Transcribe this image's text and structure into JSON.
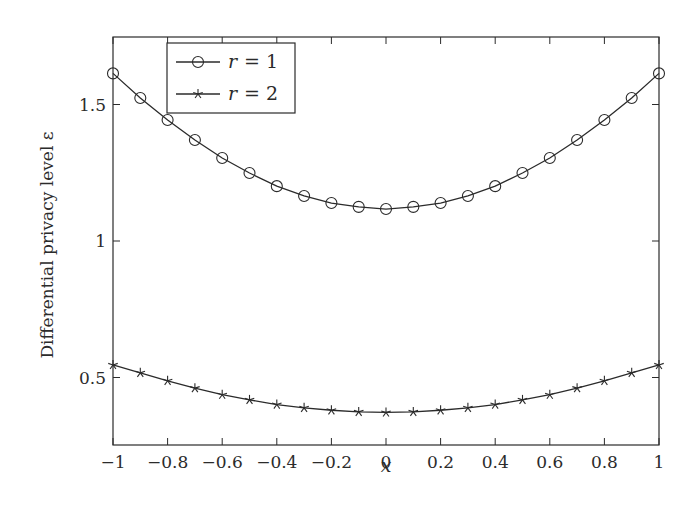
{
  "chart_data": {
    "type": "line",
    "title": "",
    "xlabel": "x",
    "ylabel": "Differential privacy level ε",
    "xlim": [
      -1,
      1
    ],
    "ylim": [
      0.3,
      1.75
    ],
    "grid": false,
    "legend_position": "upper left (inside)",
    "x_ticks": [
      -1,
      -0.8,
      -0.6,
      -0.4,
      -0.2,
      0,
      0.2,
      0.4,
      0.6,
      0.8,
      1
    ],
    "x_tick_labels": [
      "−1",
      "−0.8",
      "−0.6",
      "−0.4",
      "−0.2",
      "0",
      "0.2",
      "0.4",
      "0.6",
      "0.8",
      "1"
    ],
    "y_ticks": [
      0.5,
      1,
      1.5
    ],
    "y_tick_labels": [
      "0.5",
      "1",
      "1.5"
    ],
    "x": [
      -1,
      -0.9,
      -0.8,
      -0.7,
      -0.6,
      -0.5,
      -0.4,
      -0.3,
      -0.2,
      -0.1,
      0,
      0.1,
      0.2,
      0.3,
      0.4,
      0.5,
      0.6,
      0.7,
      0.8,
      0.9,
      1
    ],
    "series": [
      {
        "name": "r = 1",
        "marker": "circle",
        "values": [
          1.614,
          1.524,
          1.443,
          1.37,
          1.304,
          1.249,
          1.201,
          1.165,
          1.139,
          1.125,
          1.117,
          1.125,
          1.139,
          1.165,
          1.201,
          1.249,
          1.304,
          1.37,
          1.443,
          1.524,
          1.614
        ]
      },
      {
        "name": "r = 2",
        "marker": "star",
        "values": [
          0.546,
          0.517,
          0.488,
          0.461,
          0.437,
          0.418,
          0.401,
          0.389,
          0.38,
          0.374,
          0.372,
          0.374,
          0.38,
          0.389,
          0.401,
          0.418,
          0.437,
          0.461,
          0.488,
          0.517,
          0.546
        ]
      }
    ],
    "legend": [
      {
        "label_var": "r",
        "label_eq": "= 1",
        "marker": "circle"
      },
      {
        "label_var": "r",
        "label_eq": "= 2",
        "marker": "star"
      }
    ],
    "colors": {
      "line": "#2b2b2b",
      "frame": "#2b2b2b",
      "background": "#ffffff"
    }
  }
}
